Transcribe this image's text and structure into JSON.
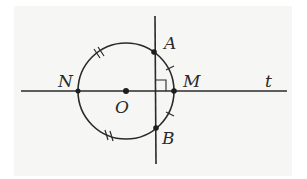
{
  "diagram": {
    "type": "geometry",
    "colors": {
      "ink": "#2a2a2a",
      "paper": "#f6f6f5"
    },
    "labels": {
      "A": "A",
      "B": "B",
      "M": "M",
      "N": "N",
      "O": "O",
      "t": "t"
    },
    "circle": {
      "center": "O",
      "cx": 126,
      "cy": 91,
      "r": 48
    },
    "lines": [
      {
        "name": "t",
        "x1": 21,
        "y1": 91,
        "x2": 287,
        "y2": 91
      },
      {
        "name": "perpendicular AB",
        "x1": 155,
        "y1": 16,
        "x2": 156,
        "y2": 164
      }
    ],
    "points": [
      {
        "name": "O",
        "x": 126,
        "y": 91
      },
      {
        "name": "N",
        "x": 78,
        "y": 91
      },
      {
        "name": "M",
        "x": 174,
        "y": 91
      },
      {
        "name": "A",
        "x": 154,
        "y": 52
      },
      {
        "name": "B",
        "x": 156,
        "y": 128
      }
    ],
    "marks": {
      "right_angle_at": "intersection of AB and t",
      "single_ticks": [
        "arc AM",
        "arc MB"
      ],
      "double_ticks": [
        "upper-left arc",
        "lower-left arc"
      ]
    }
  }
}
